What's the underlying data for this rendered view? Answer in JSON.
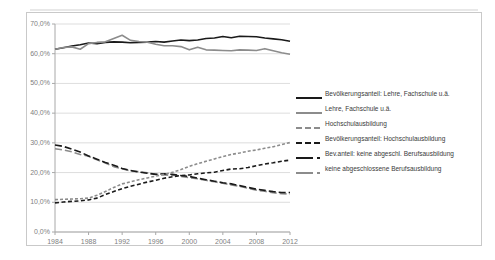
{
  "chart_data": {
    "type": "line",
    "title": "",
    "xlabel": "",
    "ylabel": "",
    "ylim": [
      0,
      70
    ],
    "xlim": [
      1984,
      2012
    ],
    "grid": true,
    "legend_position": "right",
    "y_ticks": [
      "0,0%",
      "10,0%",
      "20,0%",
      "30,0%",
      "40,0%",
      "50,0%",
      "60,0%",
      "70,0%"
    ],
    "y_tick_values": [
      0,
      10,
      20,
      30,
      40,
      50,
      60,
      70
    ],
    "x_ticks": [
      "1984",
      "1988",
      "1992",
      "1996",
      "2000",
      "2004",
      "2008",
      "2012"
    ],
    "x_tick_values": [
      1984,
      1988,
      1992,
      1996,
      2000,
      2004,
      2008,
      2012
    ],
    "x": [
      1984,
      1985,
      1986,
      1987,
      1988,
      1989,
      1990,
      1991,
      1992,
      1993,
      1994,
      1995,
      1996,
      1997,
      1998,
      1999,
      2000,
      2001,
      2002,
      2003,
      2004,
      2005,
      2006,
      2007,
      2008,
      2009,
      2010,
      2011,
      2012
    ],
    "series": [
      {
        "name": "Bevölkerungsanteil: Lehre, Fachschule u.ä.",
        "style": "solid",
        "color": "#1a1a1a",
        "width": 1.6,
        "values": [
          61.5,
          62.0,
          62.6,
          63.0,
          63.6,
          63.4,
          63.8,
          64.0,
          63.9,
          63.7,
          63.8,
          63.9,
          64.1,
          63.9,
          64.3,
          64.6,
          64.4,
          64.6,
          65.1,
          65.3,
          65.8,
          65.4,
          65.9,
          65.8,
          65.7,
          65.3,
          65.0,
          64.7,
          64.2
        ]
      },
      {
        "name": "Lehre, Fachschule u.ä.",
        "style": "solid",
        "color": "#8c8c8c",
        "width": 1.6,
        "values": [
          61.5,
          62.1,
          62.3,
          61.5,
          63.4,
          63.8,
          64.0,
          65.1,
          66.2,
          64.5,
          64.1,
          63.9,
          63.2,
          62.7,
          62.7,
          62.4,
          61.3,
          62.2,
          61.3,
          61.2,
          61.1,
          61.0,
          61.3,
          61.2,
          61.1,
          61.7,
          61.0,
          60.3,
          59.8
        ]
      },
      {
        "name": "Hochschulausbildung",
        "style": "dash-long",
        "color": "#8c8c8c",
        "width": 1.6,
        "values": [
          28.0,
          27.6,
          27.0,
          26.1,
          25.5,
          24.3,
          23.2,
          22.0,
          21.3,
          20.5,
          20.3,
          19.9,
          19.5,
          19.2,
          19.1,
          18.7,
          18.3,
          17.9,
          17.4,
          16.9,
          16.4,
          15.8,
          15.4,
          14.7,
          14.1,
          13.7,
          13.2,
          12.9,
          12.8
        ]
      },
      {
        "name": "Bevölkerungsanteil: Hochschulausbildung",
        "style": "dash-long",
        "color": "#1a1a1a",
        "width": 1.6,
        "values": [
          29.3,
          28.8,
          27.9,
          26.9,
          25.6,
          24.5,
          23.4,
          22.5,
          21.4,
          20.7,
          20.2,
          19.8,
          19.4,
          19.6,
          19.4,
          19.0,
          18.7,
          18.1,
          17.6,
          17.1,
          16.6,
          16.2,
          15.6,
          15.0,
          14.4,
          14.0,
          13.6,
          13.3,
          13.3
        ]
      },
      {
        "name": "Bev.anteil: keine abgeschl. Berufsausbildung",
        "style": "dash-short",
        "color": "#1a1a1a",
        "width": 1.6,
        "values": [
          9.8,
          10.1,
          10.3,
          10.5,
          10.8,
          11.4,
          12.6,
          13.6,
          14.6,
          15.4,
          16.1,
          16.8,
          17.4,
          18.1,
          18.6,
          19.0,
          19.2,
          19.6,
          19.9,
          20.1,
          20.7,
          21.2,
          21.3,
          21.7,
          22.3,
          22.9,
          23.3,
          23.8,
          24.2
        ]
      },
      {
        "name": "keine abgeschlossene Berufsausbildung",
        "style": "dot",
        "color": "#8c8c8c",
        "width": 1.6,
        "values": [
          10.9,
          11.0,
          11.1,
          11.2,
          11.4,
          12.4,
          13.6,
          15.0,
          16.2,
          16.9,
          17.6,
          18.2,
          18.8,
          19.4,
          20.1,
          21.0,
          22.1,
          23.0,
          23.8,
          24.6,
          25.4,
          26.1,
          26.6,
          27.2,
          27.6,
          28.2,
          28.7,
          29.4,
          30.1
        ]
      }
    ]
  },
  "legend": {
    "entries": [
      {
        "label": "Bevölkerungsanteil: Lehre, Fachschule u.ä."
      },
      {
        "label": "Lehre, Fachschule u.ä."
      },
      {
        "label": "Hochschulausbildung"
      },
      {
        "label": "Bevölkerungsanteil: Hochschulausbildung"
      },
      {
        "label": "Bev.anteil: keine abgeschl. Berufsausbildung"
      },
      {
        "label": "keine abgeschlossene Berufsausbildung"
      }
    ]
  },
  "colors": {
    "black_series": "#1a1a1a",
    "gray_series": "#8c8c8c",
    "grid": "#d4d4d4",
    "axis": "#a8a8a8",
    "frame": "#c9c9c9",
    "tick_text": "#808080"
  }
}
